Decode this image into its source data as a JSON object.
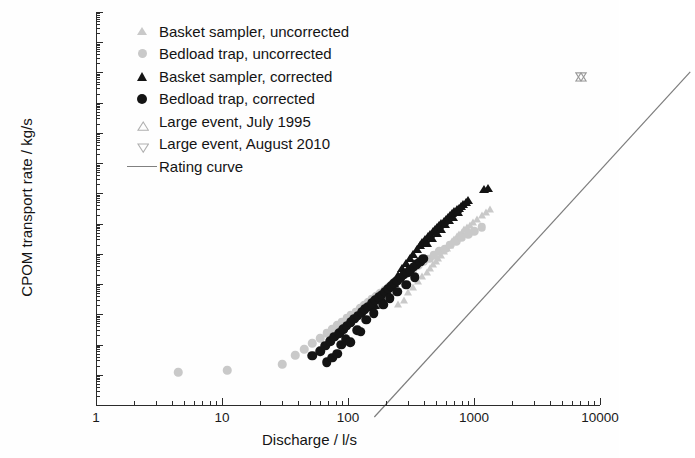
{
  "chart_data": {
    "type": "scatter",
    "title": "",
    "xlabel": "Discharge / l/s",
    "ylabel": "CPOM transport rate / kg/s",
    "xscale": "log",
    "yscale": "log",
    "xlim": [
      1,
      10000
    ],
    "ylim": [
      1e-08,
      100000
    ],
    "xticks": [
      "1",
      "10",
      "100",
      "1000",
      "10000"
    ],
    "yticks": [
      "100000",
      "10000",
      "1000",
      "100",
      "10",
      "1",
      "0.1",
      "0.01",
      "1E-3",
      "1E-4",
      "1E-5",
      "1E-6",
      "1E-7",
      "1E-8"
    ],
    "grid": false,
    "legend_position": "upper-left-inside",
    "legend": [
      {
        "label": "Basket sampler, uncorrected",
        "marker": "triangle-up",
        "fill": "#c9c9c9",
        "style": "filled"
      },
      {
        "label": "Bedload trap, uncorrected",
        "marker": "circle",
        "fill": "#c9c9c9",
        "style": "filled"
      },
      {
        "label": "Basket sampler, corrected",
        "marker": "triangle-up",
        "fill": "#141414",
        "style": "filled"
      },
      {
        "label": "Bedload trap, corrected",
        "marker": "circle",
        "fill": "#141414",
        "style": "filled"
      },
      {
        "label": "Large event, July 1995",
        "marker": "triangle-up",
        "fill": "#b0b0b0",
        "style": "open"
      },
      {
        "label": "Large event, August 2010",
        "marker": "triangle-down",
        "fill": "#b0b0b0",
        "style": "open"
      },
      {
        "label": "Rating curve",
        "marker": "line",
        "fill": "#808080",
        "style": "line"
      }
    ],
    "rating_curve": {
      "name": "Rating curve",
      "color": "#7d7d7d",
      "x": [
        28,
        9000
      ],
      "y": [
        1e-08,
        2600.0
      ]
    },
    "series": [
      {
        "name": "Basket sampler, uncorrected",
        "marker": "triangle-up",
        "color": "#c9c9c9",
        "points": [
          [
            250,
            2.2e-05
          ],
          [
            280,
            3e-05
          ],
          [
            300,
            5.5e-05
          ],
          [
            330,
            8e-05
          ],
          [
            360,
            0.00013
          ],
          [
            390,
            0.00019
          ],
          [
            420,
            0.00026
          ],
          [
            450,
            0.00034
          ],
          [
            470,
            0.00046
          ],
          [
            500,
            0.0006
          ],
          [
            520,
            0.00072
          ],
          [
            550,
            0.00095
          ],
          [
            580,
            0.0012
          ],
          [
            610,
            0.0016
          ],
          [
            640,
            0.002
          ],
          [
            670,
            0.0026
          ],
          [
            700,
            0.0031
          ],
          [
            730,
            0.0038
          ],
          [
            760,
            0.0044
          ],
          [
            800,
            0.0054
          ],
          [
            840,
            0.0064
          ],
          [
            880,
            0.0076
          ],
          [
            930,
            0.009
          ],
          [
            980,
            0.011
          ],
          [
            1050,
            0.014
          ],
          [
            1150,
            0.019
          ],
          [
            1250,
            0.024
          ],
          [
            1350,
            0.031
          ]
        ]
      },
      {
        "name": "Bedload trap, uncorrected",
        "marker": "circle",
        "color": "#c9c9c9",
        "points": [
          [
            4.5,
            1.2e-07
          ],
          [
            11,
            1.4e-07
          ],
          [
            30,
            2.2e-07
          ],
          [
            38,
            4.5e-07
          ],
          [
            45,
            7e-07
          ],
          [
            52,
            1.1e-06
          ],
          [
            60,
            1.6e-06
          ],
          [
            68,
            2.4e-06
          ],
          [
            75,
            3.2e-06
          ],
          [
            82,
            4.3e-06
          ],
          [
            90,
            5.6e-06
          ],
          [
            98,
            7.4e-06
          ],
          [
            105,
            9.2e-06
          ],
          [
            115,
            1.2e-05
          ],
          [
            125,
            1.6e-05
          ],
          [
            135,
            2e-05
          ],
          [
            145,
            2.5e-05
          ],
          [
            155,
            3.1e-05
          ],
          [
            168,
            4e-05
          ],
          [
            180,
            5e-05
          ],
          [
            195,
            6.4e-05
          ],
          [
            210,
            8e-05
          ],
          [
            225,
            0.0001
          ],
          [
            240,
            0.00013
          ],
          [
            260,
            0.00016
          ],
          [
            280,
            0.0002
          ],
          [
            300,
            0.00026
          ],
          [
            330,
            0.00033
          ],
          [
            360,
            0.00042
          ],
          [
            400,
            0.00055
          ],
          [
            440,
            0.0007
          ],
          [
            480,
            0.0009
          ],
          [
            530,
            0.0012
          ],
          [
            590,
            0.0015
          ],
          [
            650,
            0.002
          ],
          [
            720,
            0.0026
          ],
          [
            800,
            0.0034
          ],
          [
            900,
            0.0044
          ],
          [
            1000,
            0.0056
          ],
          [
            1150,
            0.0075
          ]
        ]
      },
      {
        "name": "Basket sampler, corrected",
        "marker": "triangle-up",
        "color": "#141414",
        "points": [
          [
            230,
            0.00011
          ],
          [
            250,
            0.0002
          ],
          [
            270,
            0.00034
          ],
          [
            290,
            0.0005
          ],
          [
            310,
            0.00072
          ],
          [
            330,
            0.001
          ],
          [
            350,
            0.0014
          ],
          [
            370,
            0.0019
          ],
          [
            390,
            0.0024
          ],
          [
            410,
            0.003
          ],
          [
            430,
            0.0038
          ],
          [
            450,
            0.0046
          ],
          [
            470,
            0.0056
          ],
          [
            490,
            0.0066
          ],
          [
            510,
            0.0078
          ],
          [
            530,
            0.009
          ],
          [
            550,
            0.0105
          ],
          [
            575,
            0.0125
          ],
          [
            600,
            0.0145
          ],
          [
            625,
            0.017
          ],
          [
            650,
            0.0195
          ],
          [
            675,
            0.022
          ],
          [
            700,
            0.026
          ],
          [
            730,
            0.03
          ],
          [
            760,
            0.034
          ],
          [
            790,
            0.039
          ],
          [
            820,
            0.045
          ],
          [
            860,
            0.052
          ],
          [
            900,
            0.06
          ],
          [
            1200,
            0.14
          ],
          [
            1280,
            0.155
          ],
          [
            165,
            2e-05
          ],
          [
            185,
            3.4e-05
          ],
          [
            205,
            6e-05
          ],
          [
            420,
            0.0022
          ],
          [
            460,
            0.0034
          ],
          [
            505,
            0.005
          ],
          [
            545,
            0.0068
          ],
          [
            590,
            0.0095
          ],
          [
            635,
            0.013
          ],
          [
            680,
            0.017
          ],
          [
            745,
            0.024
          ]
        ]
      },
      {
        "name": "Bedload trap, corrected",
        "marker": "circle",
        "color": "#141414",
        "points": [
          [
            52,
            4.2e-07
          ],
          [
            60,
            6e-07
          ],
          [
            66,
            9e-07
          ],
          [
            72,
            1.3e-06
          ],
          [
            78,
            1.8e-06
          ],
          [
            85,
            2.4e-06
          ],
          [
            92,
            3.2e-06
          ],
          [
            98,
            4.2e-06
          ],
          [
            105,
            5.4e-06
          ],
          [
            112,
            7e-06
          ],
          [
            120,
            9e-06
          ],
          [
            128,
            1.15e-05
          ],
          [
            136,
            1.45e-05
          ],
          [
            145,
            1.8e-05
          ],
          [
            155,
            2.3e-05
          ],
          [
            165,
            2.9e-05
          ],
          [
            175,
            3.6e-05
          ],
          [
            185,
            4.5e-05
          ],
          [
            196,
            5.6e-05
          ],
          [
            208,
            7e-05
          ],
          [
            220,
            8.6e-05
          ],
          [
            233,
            0.000106
          ],
          [
            247,
            0.00013
          ],
          [
            262,
            0.00016
          ],
          [
            278,
            0.0002
          ],
          [
            295,
            0.00024
          ],
          [
            313,
            0.0003
          ],
          [
            332,
            0.00037
          ],
          [
            352,
            0.00045
          ],
          [
            374,
            0.00055
          ],
          [
            397,
            0.00068
          ],
          [
            68,
            2.6e-07
          ],
          [
            75,
            3.6e-07
          ],
          [
            88,
            1e-06
          ],
          [
            96,
            1.5e-06
          ],
          [
            118,
            3e-06
          ],
          [
            140,
            6.5e-06
          ],
          [
            160,
            1.1e-05
          ],
          [
            190,
            2.1e-05
          ],
          [
            215,
            3.4e-05
          ],
          [
            245,
            5.5e-05
          ],
          [
            290,
            9.5e-05
          ],
          [
            340,
            0.00017
          ],
          [
            82,
            5e-07
          ],
          [
            104,
            1.2e-06
          ],
          [
            126,
            2.6e-06
          ]
        ]
      },
      {
        "name": "Large event, July 1995",
        "marker": "triangle-up",
        "color": "#9a9a9a",
        "points": [
          [
            7000,
            1050.0
          ]
        ]
      },
      {
        "name": "Large event, August 2010",
        "marker": "triangle-down",
        "color": "#9a9a9a",
        "points": [
          [
            7000,
            1050.0
          ]
        ]
      }
    ]
  }
}
